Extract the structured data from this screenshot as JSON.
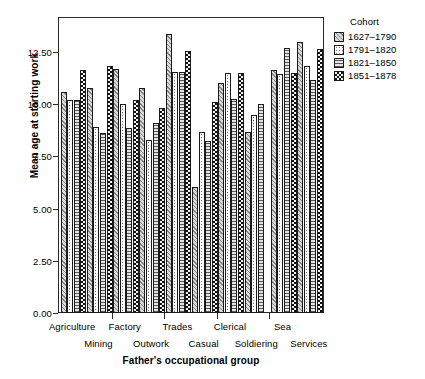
{
  "chart_data": {
    "type": "bar",
    "title": "",
    "xlabel": "Father's occupational group",
    "ylabel": "Mean age at starting work",
    "ylim": [
      0,
      14
    ],
    "yticks": [
      "0.00",
      "2.50",
      "5.00",
      "7.50",
      "10.00",
      "12.50"
    ],
    "ytick_values": [
      0,
      2.5,
      5,
      7.5,
      10,
      12.5
    ],
    "grid": false,
    "legend_title": "Cohort",
    "legend_position": "right",
    "categories": [
      "Agriculture",
      "Mining",
      "Factory",
      "Outwork",
      "Trades",
      "Casual",
      "Clerical",
      "Soldiering",
      "Sea",
      "Services"
    ],
    "series": [
      {
        "name": "1627–1790",
        "fill": "diagonal-hatch-light",
        "values": [
          10.6,
          10.8,
          11.7,
          10.8,
          13.35,
          6.05,
          11.0,
          8.65,
          11.65,
          13.0
        ]
      },
      {
        "name": "1791–1820",
        "fill": "dotted-white",
        "values": [
          10.2,
          8.9,
          10.0,
          8.3,
          11.55,
          8.65,
          11.5,
          9.5,
          11.45,
          11.85
        ]
      },
      {
        "name": "1821–1850",
        "fill": "horizontal-lines",
        "values": [
          10.2,
          8.6,
          8.85,
          9.1,
          11.55,
          8.25,
          10.25,
          10.0,
          12.7,
          11.15
        ]
      },
      {
        "name": "1851–1878",
        "fill": "checkerboard-dark",
        "values": [
          11.65,
          11.85,
          10.2,
          9.8,
          12.55,
          10.1,
          11.5,
          null,
          11.5,
          12.65
        ]
      }
    ]
  },
  "axis": {
    "y_title": "Mean age at starting work",
    "x_title": "Father's occupational group"
  },
  "legend": {
    "title": "Cohort",
    "items": [
      {
        "label": "1627–1790"
      },
      {
        "label": "1791–1820"
      },
      {
        "label": "1821–1850"
      },
      {
        "label": "1851–1878"
      }
    ]
  },
  "colors": {
    "axis": "#2b2b2b",
    "text": "#000000",
    "background": "#ffffff",
    "series_1": "#d9d9d9",
    "series_2": "#fdfdfd",
    "series_3": "#e4e4e4",
    "series_4": "#7a7a7a"
  }
}
